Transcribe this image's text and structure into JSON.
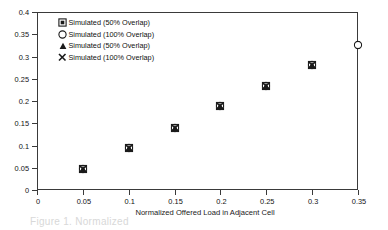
{
  "chart_data": {
    "type": "scatter",
    "title": "",
    "xlabel": "Normalized Offered Load in Adjacent Cell",
    "ylabel": "Normalized Periodic Traffic Channel Utilization",
    "xlim": [
      0,
      0.35
    ],
    "ylim": [
      0,
      0.4
    ],
    "xticks": [
      "0",
      "0.05",
      "0.1",
      "0.15",
      "0.2",
      "0.25",
      "0.3",
      "0.35"
    ],
    "xtick_values": [
      0,
      0.05,
      0.1,
      0.15,
      0.2,
      0.25,
      0.3,
      0.35
    ],
    "yticks": [
      "0",
      "0.05",
      "0.1",
      "0.15",
      "0.2",
      "0.25",
      "0.3",
      "0.35",
      "0.4"
    ],
    "ytick_values": [
      0,
      0.05,
      0.1,
      0.15,
      0.2,
      0.25,
      0.3,
      0.35,
      0.4
    ],
    "grid": false,
    "legend_position": "top-left",
    "series": [
      {
        "name": "Simulated (50% Overlap)",
        "marker": "square",
        "color": "#1a1a1a",
        "x": [
          0.05,
          0.1,
          0.15,
          0.2,
          0.25,
          0.3
        ],
        "y": [
          0.048,
          0.095,
          0.14,
          0.188,
          0.233,
          0.28
        ]
      },
      {
        "name": "Simulated (100% Overlap)",
        "marker": "circle",
        "color": "#1a1a1a",
        "x": [
          0.05,
          0.1,
          0.15,
          0.2,
          0.25,
          0.3,
          0.35
        ],
        "y": [
          0.048,
          0.095,
          0.14,
          0.188,
          0.233,
          0.28,
          0.325
        ]
      },
      {
        "name": "Simulated (50% Overlap)",
        "marker": "triangle",
        "color": "#1a1a1a",
        "x": [
          0.05,
          0.1,
          0.15,
          0.2,
          0.25,
          0.3
        ],
        "y": [
          0.048,
          0.095,
          0.14,
          0.188,
          0.233,
          0.28
        ]
      },
      {
        "name": "Simulated (100% Overlap)",
        "marker": "cross-x",
        "color": "#1a1a1a",
        "x": [
          0.05,
          0.1,
          0.15,
          0.2,
          0.25,
          0.3
        ],
        "y": [
          0.048,
          0.095,
          0.14,
          0.188,
          0.233,
          0.28
        ]
      }
    ]
  },
  "legend": {
    "entries": [
      {
        "label": "Simulated (50% Overlap)",
        "marker": "square"
      },
      {
        "label": "Simulated (100% Overlap)",
        "marker": "circle"
      },
      {
        "label": "Simulated (50% Overlap)",
        "marker": "triangle"
      },
      {
        "label": "Simulated (100% Overlap)",
        "marker": "cross-x"
      }
    ]
  },
  "caption": {
    "text": "Figure 1. Normalized"
  },
  "colors": {
    "axis": "#3a3a3a",
    "marker": "#1a1a1a",
    "background": "#ffffff"
  }
}
